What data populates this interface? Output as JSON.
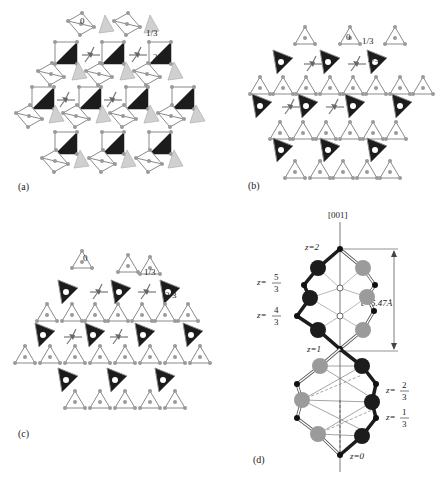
{
  "panels": {
    "a": {
      "label": "(a)",
      "levels": [
        "0",
        "1/3",
        "2/3"
      ]
    },
    "b": {
      "label": "(b)",
      "levels": [
        "0",
        "1/3",
        "2/3"
      ]
    },
    "c": {
      "label": "(c)",
      "levels": [
        "0",
        "1/3",
        "2/3"
      ]
    },
    "d": {
      "label": "(d)",
      "axis": "[001]",
      "z_labels": {
        "z2": "z=2",
        "z53_prefix": "z=",
        "z53_num": "5",
        "z53_den": "3",
        "z43_prefix": "z=",
        "z43_num": "4",
        "z43_den": "3",
        "z1": "z=1",
        "z23_prefix": "z=",
        "z23_num": "2",
        "z23_den": "3",
        "z13_prefix": "z=",
        "z13_num": "1",
        "z13_den": "3",
        "z0": "z=0"
      },
      "c_param": "c=5.47Å"
    }
  },
  "colors": {
    "line": "#8a8a8a",
    "node": "#9a9a9a",
    "dark": "#1c1c1c",
    "light_tri": "#cfcfcf",
    "gray_atom": "#9b9b9b"
  }
}
